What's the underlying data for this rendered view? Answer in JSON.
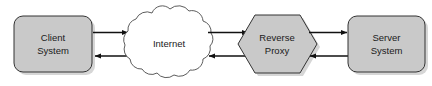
{
  "diagram": {
    "background_color": "#ffffff",
    "node_fill_color": "#c9c9c9",
    "node_stroke_color": "#333333",
    "cloud_fill_color": "#ffffff",
    "cloud_stroke_color": "#4a4a4a",
    "arrow_color": "#111111",
    "text_color": "#1a1a1a",
    "nodes": [
      {
        "id": "client",
        "shape": "rounded-rectangle",
        "line1": "Client",
        "line2": "System"
      },
      {
        "id": "internet",
        "shape": "cloud",
        "line1": "Internet",
        "line2": ""
      },
      {
        "id": "reverse-proxy",
        "shape": "hexagon",
        "line1": "Reverse",
        "line2": "Proxy"
      },
      {
        "id": "server",
        "shape": "rounded-rectangle",
        "line1": "Server",
        "line2": "System"
      }
    ],
    "connectors": [
      {
        "id": "client-to-internet",
        "direction": "right",
        "from": "client",
        "to": "internet"
      },
      {
        "id": "internet-to-client",
        "direction": "left",
        "from": "internet",
        "to": "client"
      },
      {
        "id": "internet-to-proxy",
        "direction": "right",
        "from": "internet",
        "to": "reverse-proxy"
      },
      {
        "id": "proxy-to-internet",
        "direction": "left",
        "from": "reverse-proxy",
        "to": "internet"
      },
      {
        "id": "proxy-to-server",
        "direction": "right",
        "from": "reverse-proxy",
        "to": "server"
      },
      {
        "id": "server-to-proxy",
        "direction": "left",
        "from": "server",
        "to": "reverse-proxy"
      }
    ]
  }
}
